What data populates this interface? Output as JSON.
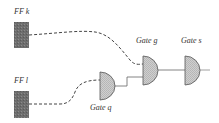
{
  "diagram": {
    "colors": {
      "ff_fill": "#6e6e6e",
      "gate_fill": "#c8c8c8",
      "gate_stroke": "#555555",
      "wire": "#444444"
    },
    "flipflops": [
      {
        "id": "ff-k",
        "label": "FF k"
      },
      {
        "id": "ff-l",
        "label": "FF l"
      }
    ],
    "gates": [
      {
        "id": "gate-q",
        "label": "Gate q"
      },
      {
        "id": "gate-g",
        "label": "Gate g"
      },
      {
        "id": "gate-s",
        "label": "Gate s"
      }
    ],
    "connections": [
      {
        "from": "FF k",
        "to": "Gate g",
        "style": "dashed"
      },
      {
        "from": "FF l",
        "to": "Gate q",
        "style": "dashed"
      },
      {
        "from": "Gate q",
        "to": "Gate g",
        "style": "solid"
      },
      {
        "from": "Gate g",
        "to": "Gate s",
        "style": "solid"
      },
      {
        "from": "Gate s",
        "to": "output",
        "style": "solid"
      }
    ]
  }
}
